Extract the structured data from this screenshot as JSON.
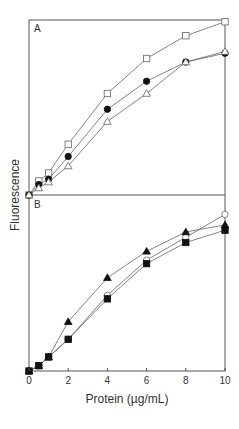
{
  "chart_data": {
    "type": "line",
    "ylabel": "Fluorescence",
    "xlabel": "Protein (µg/mL)",
    "xlim": [
      0,
      10
    ],
    "ylim": [
      0,
      100
    ],
    "x_ticks": [
      0,
      2,
      4,
      6,
      8,
      10
    ],
    "y_ticks": [],
    "grid": false,
    "legend": null,
    "panels": [
      {
        "label": "A",
        "x": [
          0,
          0.5,
          1,
          2,
          4,
          6,
          8,
          10
        ],
        "series": [
          {
            "name": "open square",
            "marker": "square-open",
            "values": [
              0,
              8,
              12.6,
              29,
              58,
              78,
              91,
              99
            ]
          },
          {
            "name": "filled circle",
            "marker": "circle-filled",
            "values": [
              0,
              6,
              9,
              22,
              49,
              65,
              76,
              81
            ]
          },
          {
            "name": "open triangle",
            "marker": "triangle-open",
            "values": [
              0,
              4,
              7.4,
              16.6,
              42,
              58,
              76,
              82
            ]
          }
        ]
      },
      {
        "label": "B",
        "x": [
          0,
          0.5,
          1,
          2,
          4,
          6,
          8,
          10
        ],
        "series": [
          {
            "name": "open circle",
            "marker": "circle-open",
            "values": [
              0,
              3,
              8,
              18,
              43,
              63,
              76,
              89
            ]
          },
          {
            "name": "filled triangle",
            "marker": "triangle-filled",
            "values": [
              0,
              3,
              8,
              28,
              53,
              68,
              79,
              83
            ]
          },
          {
            "name": "filled square",
            "marker": "square-filled",
            "values": [
              0,
              3,
              8,
              18,
              41,
              61,
              73,
              80
            ]
          }
        ]
      }
    ]
  },
  "labels": {
    "panel_a": "A",
    "panel_b": "B",
    "ylabel": "Fluorescence",
    "xlabel": "Protein (µg/mL)"
  },
  "colors": {
    "axis": "#555555",
    "line": "#666666",
    "marker": "#111111"
  }
}
